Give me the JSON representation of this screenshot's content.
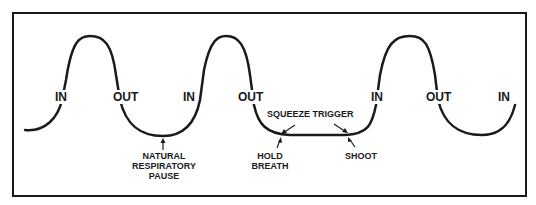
{
  "diagram": {
    "type": "breathing-cycle-waveform",
    "stroke_color": "#1a1a1a",
    "background": "#ffffff",
    "phase_labels": [
      {
        "id": "in-1",
        "text": "IN"
      },
      {
        "id": "out-1",
        "text": "OUT"
      },
      {
        "id": "in-2",
        "text": "IN"
      },
      {
        "id": "out-2",
        "text": "OUT"
      },
      {
        "id": "in-3",
        "text": "IN"
      },
      {
        "id": "out-3",
        "text": "OUT"
      },
      {
        "id": "in-4",
        "text": "IN"
      }
    ],
    "annotations": {
      "natural_pause": [
        "NATURAL",
        "RESPIRATORY",
        "PAUSE"
      ],
      "squeeze_trigger": "SQUEEZE TRIGGER",
      "hold_breath": [
        "HOLD",
        "BREATH"
      ],
      "shoot": "SHOOT"
    }
  }
}
